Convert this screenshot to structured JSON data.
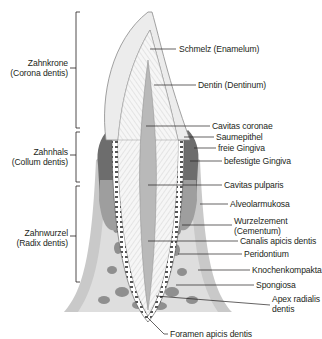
{
  "diagram": {
    "regions": [
      {
        "id": "crown",
        "label": "Zahnkrone",
        "latin": "(Corona dentis)"
      },
      {
        "id": "neck",
        "label": "Zahnhals",
        "latin": "(Collum dentis)"
      },
      {
        "id": "root",
        "label": "Zahnwurzel",
        "latin": "(Radix dentis)"
      }
    ],
    "labels": {
      "enamel": "Schmelz (Enamelum)",
      "dentin": "Dentin (Dentinum)",
      "cavitas_coronae": "Cavitas coronae",
      "saumepithel": "Saumepithel",
      "freie_gingiva": "freie Gingiva",
      "befestigte_gingiva": "befestigte Gingiva",
      "cavitas_pulparis": "Cavitas pulparis",
      "alveolarmukosa": "Alveolarmukosa",
      "wurzelzement_1": "Wurzelzement",
      "wurzelzement_2": "(Cementum)",
      "canalis": "Canalis apicis dentis",
      "peridontium": "Peridontium",
      "knochenkompakta": "Knochenkompakta",
      "spongiosa": "Spongiosa",
      "apex_1": "Apex radialis",
      "apex_2": "dentis",
      "foramen": "Foramen apicis dentis"
    },
    "colors": {
      "enamel": "#ececec",
      "dentin": "#f4f4f4",
      "pulp": "#b9b9b9",
      "gingiva_dark": "#6d6d6d",
      "gingiva_mid": "#9a9a9a",
      "mucosa": "#c9c9c9",
      "bone": "#dcdcdc",
      "spongiosa": "#8c8c8c",
      "line": "#231f20"
    }
  }
}
